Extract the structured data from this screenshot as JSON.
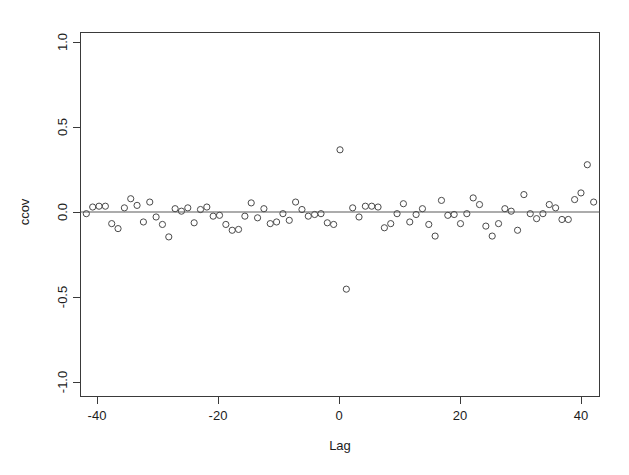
{
  "chart_data": {
    "type": "scatter",
    "title": "",
    "xlabel": "Lag",
    "ylabel": "ccov",
    "xlim": [
      -41,
      41
    ],
    "ylim": [
      -1.1,
      1.1
    ],
    "grid": false,
    "legend": null,
    "reference_lines": [
      {
        "orientation": "horizontal",
        "value": 0.0
      }
    ],
    "xticks": [
      -40,
      -20,
      0,
      20,
      40
    ],
    "xticklabels": [
      "-40",
      "-20",
      "0",
      "20",
      "40"
    ],
    "yticks": [
      -1.0,
      -0.5,
      0.0,
      0.5,
      1.0
    ],
    "yticklabels": [
      "-1.0",
      "-0.5",
      "0.0",
      "0.5",
      "1.0"
    ],
    "marker": "open-circle",
    "marker_color": "#4a4a4a",
    "x": [
      -40,
      -39,
      -38,
      -37,
      -36,
      -35,
      -34,
      -33,
      -32,
      -31,
      -30,
      -29,
      -28,
      -27,
      -26,
      -25,
      -24,
      -23,
      -22,
      -21,
      -20,
      -19,
      -18,
      -17,
      -16,
      -15,
      -14,
      -13,
      -12,
      -11,
      -10,
      -9,
      -8,
      -7,
      -6,
      -5,
      -4,
      -3,
      -2,
      -1,
      0,
      1,
      2,
      3,
      4,
      5,
      6,
      7,
      8,
      9,
      10,
      11,
      12,
      13,
      14,
      15,
      16,
      17,
      18,
      19,
      20,
      21,
      22,
      23,
      24,
      25,
      26,
      27,
      28,
      29,
      30,
      31,
      32,
      33,
      34,
      35,
      36,
      37,
      38,
      39,
      40
    ],
    "y": [
      0.005,
      0.045,
      0.05,
      0.05,
      -0.055,
      -0.085,
      0.04,
      0.095,
      0.055,
      -0.045,
      0.075,
      -0.015,
      -0.06,
      -0.135,
      0.035,
      0.02,
      0.04,
      -0.05,
      0.03,
      0.045,
      -0.01,
      -0.005,
      -0.06,
      -0.095,
      -0.09,
      -0.01,
      0.07,
      -0.02,
      0.035,
      -0.055,
      -0.045,
      0.005,
      -0.035,
      0.075,
      0.03,
      -0.01,
      0.0,
      0.005,
      -0.05,
      -0.06,
      0.39,
      -0.45,
      0.04,
      -0.015,
      0.05,
      0.05,
      0.045,
      -0.08,
      -0.055,
      0.005,
      0.065,
      -0.045,
      0.0,
      0.035,
      -0.06,
      -0.13,
      0.085,
      -0.005,
      0.0,
      -0.055,
      0.005,
      0.1,
      0.06,
      -0.07,
      -0.13,
      -0.055,
      0.035,
      0.02,
      -0.095,
      0.12,
      0.005,
      -0.025,
      0.005,
      0.06,
      0.04,
      -0.03,
      -0.03,
      0.09,
      0.13,
      0.3,
      0.075
    ],
    "faded_points": [
      {
        "x": 39,
        "y": 0.3,
        "note": "lighter rendered marker"
      }
    ],
    "n_points": 81
  },
  "figure": {
    "background_color": "#ffffff",
    "axis_color": "#3a3a3a",
    "text_color": "#1c1c1c",
    "panel_left_px": 80,
    "panel_right_px": 600,
    "panel_top_px": 32,
    "panel_bottom_px": 397
  }
}
